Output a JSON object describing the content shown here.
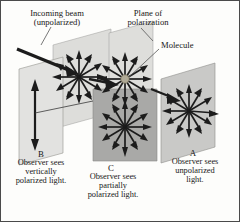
{
  "figure": {
    "background_color": "#fdfdfb",
    "border_color": "#4a4a4a",
    "ink_color": "#171717"
  },
  "labels": {
    "incoming_beam": "Incoming beam\n(unpolarized)",
    "plane_of_polarization": "Plane of\npolarization",
    "molecule": "Molecule"
  },
  "observers": [
    {
      "id": "B",
      "caption": "Observer sees\nvertically\npolarized light.",
      "plane_color": "#e2e2e0",
      "arrows": "single-vertical-double-headed"
    },
    {
      "id": "C",
      "caption": "Observer sees\npartially\npolarized light.",
      "plane_color": "#a9a9a7",
      "arrows": "radial-burst-12"
    },
    {
      "id": "A",
      "caption": "Observer sees\nunpolarized\nlight.",
      "plane_color": "#c9c9c7",
      "arrows": "radial-burst-12"
    }
  ],
  "graphics": {
    "plane_light": "#e2e2e0",
    "plane_mid": "#cfcfcd",
    "plane_dark": "#a9a9a7",
    "plane_edge": "#8e8e8c",
    "arrow_color": "#1c1c1c",
    "beam_color": "#222222",
    "molecule_color": "#b0aa96",
    "molecule_edge": "#7a745f",
    "leader_color": "#555555",
    "burst_spokes": 12
  }
}
